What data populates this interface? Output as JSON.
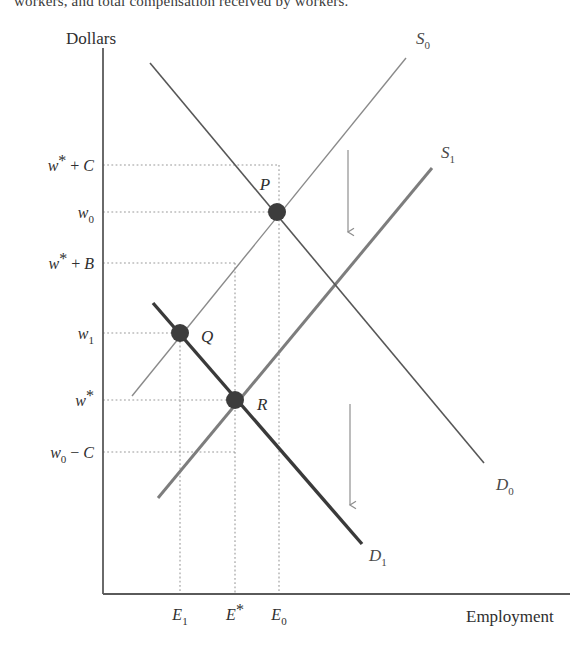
{
  "caption": {
    "text": "workers, and total compensation received by workers."
  },
  "figure": {
    "axes": {
      "y_title": "Dollars",
      "x_title": "Employment",
      "origin": {
        "x": 103,
        "y": 594
      },
      "y_top": 48,
      "x_right": 570
    },
    "y_ticks": [
      {
        "id": "w-star-plus-c",
        "main": "w",
        "star": "*",
        "op": " + ",
        "extra": "C",
        "sub": "",
        "y": 165,
        "label_x": 94
      },
      {
        "id": "w0",
        "main": "w",
        "star": "",
        "op": "",
        "extra": "",
        "sub": "0",
        "y": 212,
        "label_x": 94
      },
      {
        "id": "w-star-plus-b",
        "main": "w",
        "star": "*",
        "op": " + ",
        "extra": "B",
        "sub": "",
        "y": 263,
        "label_x": 94
      },
      {
        "id": "w1",
        "main": "w",
        "star": "",
        "op": "",
        "extra": "",
        "sub": "1",
        "y": 333,
        "label_x": 94
      },
      {
        "id": "w-star",
        "main": "w",
        "star": "*",
        "op": "",
        "extra": "",
        "sub": "",
        "y": 400,
        "label_x": 94
      },
      {
        "id": "w0-minus-c",
        "main": "w",
        "star": "",
        "op": " − ",
        "extra": "C",
        "sub": "0",
        "y": 452,
        "label_x": 94
      }
    ],
    "x_ticks": [
      {
        "id": "e1",
        "main": "E",
        "star": "",
        "sub": "1",
        "x": 180,
        "label_y": 620
      },
      {
        "id": "e-star",
        "main": "E",
        "star": "*",
        "sub": "",
        "x": 235,
        "label_y": 620
      },
      {
        "id": "e0",
        "main": "E",
        "star": "",
        "sub": "0",
        "x": 279,
        "label_y": 620
      }
    ],
    "curves": [
      {
        "id": "supply-0",
        "name": "S0",
        "label_main": "S",
        "label_sub": "0",
        "label_x": 416,
        "label_y": 44,
        "x1": 132,
        "y1": 396,
        "x2": 406,
        "y2": 58,
        "stroke": "#8a8a8a",
        "width": 1.4
      },
      {
        "id": "supply-1",
        "name": "S1",
        "label_main": "S",
        "label_sub": "1",
        "label_x": 441,
        "label_y": 158,
        "x1": 158,
        "y1": 498,
        "x2": 432,
        "y2": 168,
        "stroke": "#7d7d7d",
        "width": 3.0
      },
      {
        "id": "demand-0",
        "name": "D0",
        "label_main": "D",
        "label_sub": "0",
        "label_x": 496,
        "label_y": 490,
        "x1": 150,
        "y1": 63,
        "x2": 484,
        "y2": 463,
        "stroke": "#575757",
        "width": 1.6
      },
      {
        "id": "demand-1",
        "name": "D1",
        "label_main": "D",
        "label_sub": "1",
        "label_x": 369,
        "label_y": 561,
        "x1": 153,
        "y1": 303,
        "x2": 362,
        "y2": 544,
        "stroke": "#3a3a3a",
        "width": 3.4
      }
    ],
    "points": [
      {
        "id": "point-p",
        "label": "P",
        "x": 277,
        "y": 212,
        "label_x": 265,
        "label_y": 190,
        "r": 9
      },
      {
        "id": "point-q",
        "label": "Q",
        "x": 180,
        "y": 333,
        "label_x": 201,
        "label_y": 342,
        "r": 9
      },
      {
        "id": "point-r",
        "label": "R",
        "x": 235,
        "y": 400,
        "label_x": 257,
        "label_y": 410,
        "r": 9
      }
    ],
    "shift_arrows": [
      {
        "id": "demand-shift-arrow",
        "x": 348,
        "y1": 150,
        "y2": 232
      },
      {
        "id": "supply-shift-arrow",
        "x": 350,
        "y1": 404,
        "y2": 505
      }
    ],
    "guide_lines": [
      {
        "id": "guide-w-star-plus-c",
        "x1": 103,
        "y1": 165,
        "x2": 277,
        "y2": 165
      },
      {
        "id": "guide-w0",
        "x1": 103,
        "y1": 212,
        "x2": 277,
        "y2": 212
      },
      {
        "id": "guide-w-star-plus-b",
        "x1": 103,
        "y1": 263,
        "x2": 235,
        "y2": 263
      },
      {
        "id": "guide-w1",
        "x1": 103,
        "y1": 333,
        "x2": 180,
        "y2": 333
      },
      {
        "id": "guide-w-star",
        "x1": 103,
        "y1": 400,
        "x2": 235,
        "y2": 400
      },
      {
        "id": "guide-w0-minus-c",
        "x1": 103,
        "y1": 452,
        "x2": 235,
        "y2": 452
      },
      {
        "id": "guide-e1",
        "x1": 180,
        "y1": 333,
        "x2": 180,
        "y2": 594
      },
      {
        "id": "guide-e-star",
        "x1": 235,
        "y1": 263,
        "x2": 235,
        "y2": 594
      },
      {
        "id": "guide-e0",
        "x1": 279,
        "y1": 165,
        "x2": 279,
        "y2": 594
      }
    ],
    "colors": {
      "axis": "#5a5a5a",
      "guide": "#9a9a9a",
      "point": "#3c3c3c",
      "arrow": "#8f8f8f",
      "text": "#2f2f2f"
    }
  }
}
